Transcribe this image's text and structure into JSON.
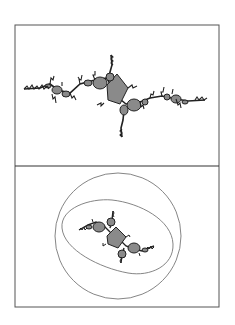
{
  "figure": {
    "panels": [
      {
        "name": "top",
        "description": "Julia set (filled, dendritic chain of bulbs)"
      },
      {
        "name": "bottom",
        "description": "Julia set enclosed by equipotential curves (circle and oval)"
      }
    ],
    "colors": {
      "frame": "#555555",
      "fill": "#8a8a8a",
      "outline": "#222222",
      "curve": "#777777",
      "background": "#ffffff"
    }
  }
}
